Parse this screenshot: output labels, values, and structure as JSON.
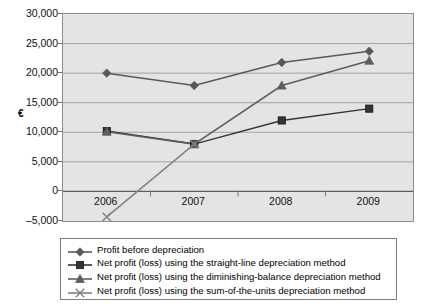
{
  "chart_data": {
    "type": "line",
    "title": "",
    "subtitle": "",
    "xlabel": "",
    "ylabel": "€",
    "categories": [
      "2006",
      "2007",
      "2008",
      "2009"
    ],
    "ylim": [
      -5000,
      30000
    ],
    "ytick_labels": [
      "30,000",
      "25,000",
      "20,000",
      "15,000",
      "10,000",
      "5,000",
      "0",
      "–5,000"
    ],
    "ytick_values": [
      30000,
      25000,
      20000,
      15000,
      10000,
      5000,
      0,
      -5000
    ],
    "grid": true,
    "legend_position": "bottom",
    "series": [
      {
        "name": "Profit before depreciation",
        "marker": "diamond",
        "color": "#595959",
        "values": [
          20000,
          17900,
          21800,
          23700
        ]
      },
      {
        "name": "Net profit (loss) using the straight-line depreciation method",
        "marker": "square",
        "color": "#333333",
        "values": [
          10200,
          8000,
          12000,
          14000
        ]
      },
      {
        "name": "Net profit (loss) using the diminishing-balance depreciation method",
        "marker": "triangle",
        "color": "#5e5e5e",
        "values": [
          10100,
          8000,
          17900,
          22100
        ]
      },
      {
        "name": "Net profit (loss) using the sum-of-the-units depreciation method",
        "marker": "cross",
        "color": "#828282",
        "values": [
          -4300,
          8000,
          null,
          null
        ]
      }
    ]
  },
  "legend": {
    "entries": [
      {
        "label": "Profit before depreciation",
        "marker": "diamond"
      },
      {
        "label": "Net profit (loss) using the straight-line depreciation method",
        "marker": "square"
      },
      {
        "label": "Net profit (loss) using the diminishing-balance depreciation method",
        "marker": "triangle"
      },
      {
        "label": "Net profit (loss) using the sum-of-the-units depreciation method",
        "marker": "cross"
      }
    ]
  },
  "colors": {
    "plot_background": "#e4e4e4",
    "gridline": "#9a9a9a",
    "axis": "#6f6f6f",
    "page_background": "#ffffff"
  }
}
